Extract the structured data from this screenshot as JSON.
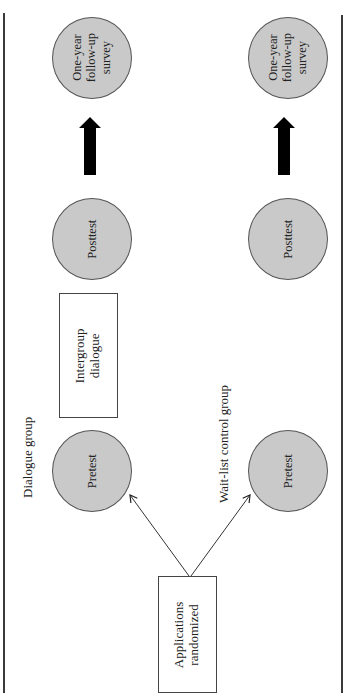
{
  "diagram": {
    "type": "flowchart",
    "orientation": "rotated-90-ccw",
    "colors": {
      "circle_fill": "#c9c9c9",
      "circle_stroke": "#555555",
      "box_stroke": "#444444",
      "arrow": "#000000",
      "frame": "#3a3a3a"
    },
    "start": {
      "label_line1": "Applications",
      "label_line2": "randomized"
    },
    "groups": [
      {
        "name": "Dialogue group",
        "pretest": "Pretest",
        "intervention": {
          "line1": "Intergroup",
          "line2": "dialogue"
        },
        "posttest": "Posttest",
        "followup": {
          "line1": "One-year",
          "line2": "follow-up",
          "line3": "survey"
        }
      },
      {
        "name": "Wait-list control group",
        "pretest": "Pretest",
        "posttest": "Posttest",
        "followup": {
          "line1": "One-year",
          "line2": "follow-up",
          "line3": "survey"
        }
      }
    ],
    "edges": [
      {
        "from": "Applications randomized",
        "to": "Dialogue group Pretest",
        "style": "thin-arrow"
      },
      {
        "from": "Applications randomized",
        "to": "Wait-list control group Pretest",
        "style": "thin-arrow"
      },
      {
        "from": "Dialogue group Posttest",
        "to": "Dialogue group One-year follow-up survey",
        "style": "bold-arrow"
      },
      {
        "from": "Wait-list control group Posttest",
        "to": "Wait-list control group One-year follow-up survey",
        "style": "bold-arrow"
      }
    ]
  }
}
